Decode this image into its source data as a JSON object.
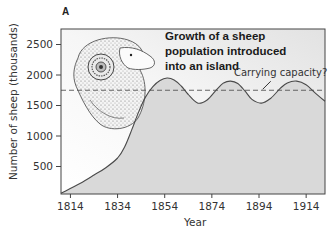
{
  "chart_data": {
    "type": "area",
    "panel_label": "A",
    "title_lines": [
      "Growth of a sheep",
      "population introduced",
      "into an island"
    ],
    "xlabel": "Year",
    "ylabel": "Number of sheep (thousands)",
    "xlim": [
      1810,
      1922
    ],
    "ylim": [
      0,
      2700
    ],
    "xticks": [
      1814,
      1834,
      1854,
      1874,
      1894,
      1914
    ],
    "xtick_labels": [
      "1814",
      "1834",
      "1854",
      "1874",
      "1894",
      "1914"
    ],
    "yticks": [
      500,
      1000,
      1500,
      2000,
      2500
    ],
    "ytick_labels": [
      "500",
      "1000",
      "1500",
      "2000",
      "2500"
    ],
    "grid": false,
    "series": [
      {
        "name": "Sheep population",
        "x": [
          1810,
          1818,
          1824,
          1829,
          1834,
          1837,
          1840,
          1843,
          1846,
          1849,
          1852,
          1855,
          1858,
          1861,
          1864,
          1868,
          1872,
          1876,
          1879,
          1882,
          1885,
          1888,
          1891,
          1895,
          1899,
          1903,
          1906,
          1910,
          1914,
          1918,
          1922
        ],
        "y": [
          60,
          220,
          360,
          480,
          640,
          820,
          1100,
          1400,
          1650,
          1810,
          1910,
          1950,
          1920,
          1820,
          1680,
          1540,
          1590,
          1760,
          1870,
          1900,
          1860,
          1740,
          1600,
          1540,
          1620,
          1780,
          1870,
          1900,
          1840,
          1700,
          1570
        ]
      }
    ],
    "reference_lines": [
      {
        "name": "Carrying capacity",
        "y": 1750,
        "style": "dashed"
      }
    ],
    "annotations": [
      {
        "text": "Carrying capacity?",
        "points_to": {
          "x": 1896,
          "y": 1750
        }
      }
    ],
    "illustration": "sheep-head (ram with curled horn)",
    "colors": {
      "fill_under_curve": "#d9d9d9",
      "plot_background": "#f2f2f2",
      "line": "#4a4a4a",
      "axis": "#444444"
    }
  }
}
